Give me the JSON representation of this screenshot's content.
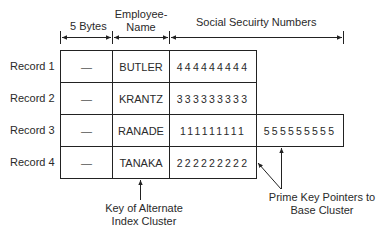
{
  "header": {
    "col_bytes": "5 Bytes",
    "col_name_line1": "Employee-",
    "col_name_line2": "Name",
    "col_ssn": "Social Secuirty Numbers"
  },
  "records": [
    {
      "label": "Record 1",
      "bytes": "—",
      "name": "BUTLER",
      "ssn": [
        "444444444"
      ]
    },
    {
      "label": "Record 2",
      "bytes": "—",
      "name": "KRANTZ",
      "ssn": [
        "333333333"
      ]
    },
    {
      "label": "Record 3",
      "bytes": "—",
      "name": "RANADE",
      "ssn": [
        "111111111",
        "555555555"
      ]
    },
    {
      "label": "Record 4",
      "bytes": "—",
      "name": "TANAKA",
      "ssn": [
        "222222222"
      ]
    }
  ],
  "annotations": {
    "key_line1": "Key of Alternate",
    "key_line2": "Index Cluster",
    "prime_line1": "Prime Key Pointers to",
    "prime_line2": "Base Cluster"
  }
}
